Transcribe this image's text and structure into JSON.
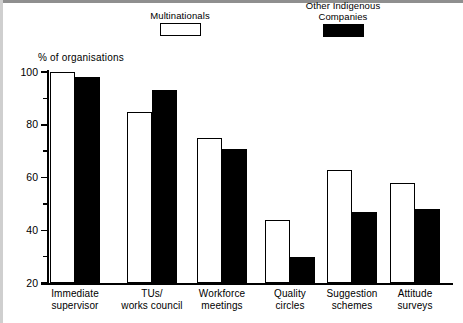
{
  "chart_data": {
    "type": "bar",
    "title": "",
    "subtitle": "",
    "xlabel": "",
    "ylabel": "% of organisations",
    "ylim": [
      20,
      100
    ],
    "ytick_labels": [
      "100",
      "80",
      "60",
      "40",
      "20"
    ],
    "ytick_values": [
      100,
      80,
      60,
      40,
      20
    ],
    "yminor_values": [
      90,
      70,
      50,
      30
    ],
    "grid": false,
    "legend_position": "top",
    "categories": [
      "Immediate\nsupervisor",
      "TUs/\nworks council",
      "Workforce\nmeetings",
      "Quality\ncircles",
      "Suggestion\nschemes",
      "Attitude\nsurveys"
    ],
    "series": [
      {
        "name": "Multinationals",
        "style": "open",
        "color": "#ffffff",
        "edge_color": "#000000",
        "values": [
          100,
          85,
          75,
          44,
          63,
          58
        ]
      },
      {
        "name": "Other Indigenous\nCompanies",
        "style": "filled",
        "color": "#000000",
        "edge_color": "#000000",
        "values": [
          98,
          93,
          71,
          30,
          47,
          48
        ]
      }
    ],
    "annotations": []
  },
  "legend": {
    "entries": [
      {
        "label": "Multinationals",
        "swatch": "open-rect-swatch"
      },
      {
        "label": "Other Indigenous\nCompanies",
        "swatch": "filled-rect-swatch"
      }
    ]
  },
  "axis": {
    "y_title": "% of organisations"
  }
}
